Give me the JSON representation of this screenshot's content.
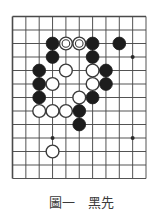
{
  "figure": {
    "caption_label": "圖一",
    "caption_prompt": "黑先",
    "caption_full": "圖一　黑先"
  },
  "board": {
    "type": "go-board-diagram",
    "description": "Go (weiqi) life-and-death problem diagram, partial board showing upper-left/upper-middle area",
    "grid_cols": 11,
    "grid_rows": 13,
    "line_color": "#4a4a4a",
    "board_color": "#ffffff",
    "black_stone_color": "#1d1d1d",
    "white_stone_color": "#ffffff",
    "white_stone_border_color": "#3a3a3a",
    "star_point_color": "#2a2a2a",
    "star_points": [
      {
        "col": 3,
        "row": 3
      },
      {
        "col": 9,
        "row": 3
      },
      {
        "col": 3,
        "row": 9
      },
      {
        "col": 9,
        "row": 9
      }
    ],
    "stones": [
      {
        "col": 3,
        "row": 2,
        "color": "black",
        "marked": false
      },
      {
        "col": 4,
        "row": 2,
        "color": "white",
        "marked": true
      },
      {
        "col": 5,
        "row": 2,
        "color": "white",
        "marked": true
      },
      {
        "col": 6,
        "row": 2,
        "color": "black",
        "marked": false
      },
      {
        "col": 8,
        "row": 2,
        "color": "black",
        "marked": false
      },
      {
        "col": 3,
        "row": 3,
        "color": "black",
        "marked": false
      },
      {
        "col": 6,
        "row": 3,
        "color": "black",
        "marked": false
      },
      {
        "col": 2,
        "row": 4,
        "color": "black",
        "marked": false
      },
      {
        "col": 4,
        "row": 4,
        "color": "white",
        "marked": false
      },
      {
        "col": 6,
        "row": 4,
        "color": "white",
        "marked": false
      },
      {
        "col": 7,
        "row": 4,
        "color": "black",
        "marked": false
      },
      {
        "col": 2,
        "row": 5,
        "color": "black",
        "marked": false
      },
      {
        "col": 3,
        "row": 5,
        "color": "white",
        "marked": false
      },
      {
        "col": 6,
        "row": 5,
        "color": "white",
        "marked": false
      },
      {
        "col": 7,
        "row": 5,
        "color": "black",
        "marked": false
      },
      {
        "col": 2,
        "row": 6,
        "color": "black",
        "marked": false
      },
      {
        "col": 5,
        "row": 6,
        "color": "white",
        "marked": false
      },
      {
        "col": 6,
        "row": 6,
        "color": "black",
        "marked": false
      },
      {
        "col": 2,
        "row": 7,
        "color": "white",
        "marked": false
      },
      {
        "col": 3,
        "row": 7,
        "color": "white",
        "marked": false
      },
      {
        "col": 4,
        "row": 7,
        "color": "white",
        "marked": false
      },
      {
        "col": 5,
        "row": 7,
        "color": "black",
        "marked": false
      },
      {
        "col": 5,
        "row": 8,
        "color": "black",
        "marked": false
      },
      {
        "col": 3,
        "row": 10,
        "color": "white",
        "marked": false
      }
    ]
  }
}
